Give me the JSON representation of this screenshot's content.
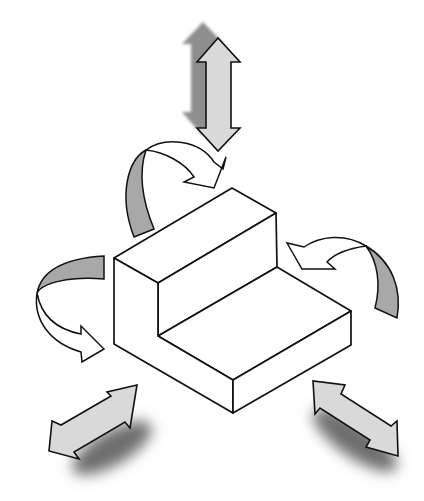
{
  "diagram": {
    "colors": {
      "background": "#ffffff",
      "outline": "#111111",
      "arrow_fill_light": "#d9d9d9",
      "arrow_fill_dark": "#a8a8a8",
      "shadow": "#6e6e6e",
      "block_fill": "#ffffff"
    },
    "elements": [
      {
        "id": "vertical-double-arrow",
        "kind": "translation",
        "direction": "up-down"
      },
      {
        "id": "curved-arrow-top-left",
        "kind": "rotation",
        "direction": "clockwise-over-top"
      },
      {
        "id": "curved-arrow-left",
        "kind": "rotation",
        "direction": "around-left-side"
      },
      {
        "id": "curved-arrow-right",
        "kind": "rotation",
        "direction": "around-right-side"
      },
      {
        "id": "diagonal-arrow-bottom-left",
        "kind": "translation",
        "direction": "front-left to back-right"
      },
      {
        "id": "diagonal-arrow-bottom-right",
        "kind": "translation",
        "direction": "back-left to front-right"
      },
      {
        "id": "stepped-block",
        "kind": "object",
        "shape": "L-profile step"
      }
    ]
  }
}
